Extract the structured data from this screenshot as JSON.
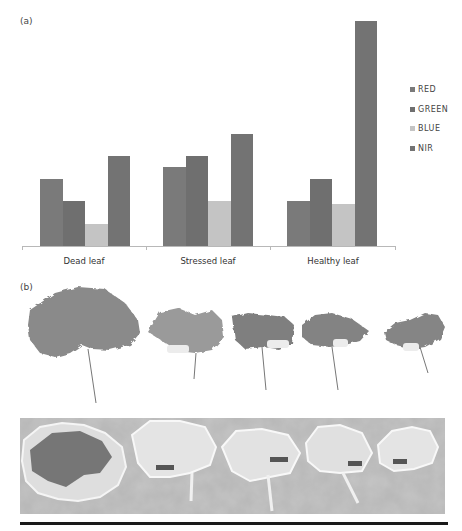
{
  "panels": {
    "a_label": "(a)",
    "b_label": "(b)"
  },
  "chart_data": {
    "type": "bar",
    "title": "",
    "xlabel": "",
    "ylabel": "",
    "categories": [
      "Dead leaf",
      "Stressed leaf",
      "Healthy leaf"
    ],
    "series": [
      {
        "name": "RED",
        "color": "#7a7a7a",
        "values": [
          3.0,
          3.5,
          2.0
        ]
      },
      {
        "name": "GREEN",
        "color": "#6f6f6f",
        "values": [
          2.0,
          4.0,
          3.0
        ]
      },
      {
        "name": "BLUE",
        "color": "#c4c4c4",
        "values": [
          1.0,
          2.0,
          1.85
        ]
      },
      {
        "name": "NIR",
        "color": "#737373",
        "values": [
          4.0,
          5.0,
          10.0
        ]
      }
    ],
    "ylim": [
      0,
      10
    ],
    "y_axis_visible": false,
    "grid": false,
    "legend_position": "right",
    "units": "relative reflectance (no axis ticks shown)"
  },
  "legend": [
    "RED",
    "GREEN",
    "BLUE",
    "NIR"
  ],
  "photos": {
    "top_row_description": "Five leaves from healthy to dead (grayscale photograph)",
    "bottom_row_description": "False-color/processed image of the same five leaves",
    "leaf_count": 5
  }
}
